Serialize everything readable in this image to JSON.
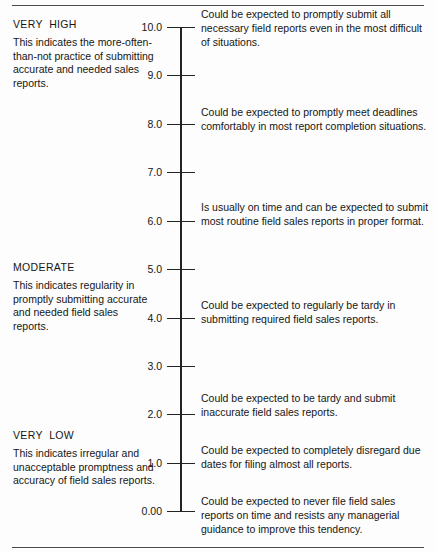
{
  "figure": {
    "name": "behaviorally-anchored-rating-scale",
    "orientation": "vertical",
    "axis": {
      "min": 0.0,
      "max": 10.0,
      "ticks": [
        {
          "label": "10.0",
          "value": 10.0
        },
        {
          "label": "9.0",
          "value": 9.0
        },
        {
          "label": "8.0",
          "value": 8.0
        },
        {
          "label": "7.0",
          "value": 7.0
        },
        {
          "label": "6.0",
          "value": 6.0
        },
        {
          "label": "5.0",
          "value": 5.0
        },
        {
          "label": "4.0",
          "value": 4.0
        },
        {
          "label": "3.0",
          "value": 3.0
        },
        {
          "label": "2.0",
          "value": 2.0
        },
        {
          "label": "1.0",
          "value": 1.0
        },
        {
          "label": "0.00",
          "value": 0.0
        }
      ]
    }
  },
  "anchors": [
    {
      "title": "VERY  HIGH",
      "description": "This indicates the more-often-than-not practice of submitting accurate and needed sales reports."
    },
    {
      "title": "MODERATE",
      "description": "This indicates regularity in promptly submitting accurate and needed field sales reports."
    },
    {
      "title": "VERY  LOW",
      "description": "This indicates irregular and unacceptable promptness and accuracy of field sales reports."
    }
  ],
  "statements": [
    {
      "anchor_value": 10.0,
      "text": "Could be expected to promptly submit all necessary field reports even in the most difficult of situations."
    },
    {
      "anchor_value": 8.0,
      "text": "Could be expected to promptly meet deadlines comfortably in most report completion situations."
    },
    {
      "anchor_value": 6.0,
      "text": "Is usually on time and can be expected to submit most routine field sales reports in proper format."
    },
    {
      "anchor_value": 4.0,
      "text": "Could be expected to regularly be tardy in submitting required field sales reports."
    },
    {
      "anchor_value": 2.0,
      "text": "Could be expected to be tardy and submit inaccurate field sales reports."
    },
    {
      "anchor_value": 1.0,
      "text": "Could be expected to completely disregard due dates for filing almost all reports."
    },
    {
      "anchor_value": 0.0,
      "text": "Could be expected to never file field sales reports on time and resists any managerial guidance to improve this tendency."
    }
  ],
  "colors": {
    "ink": "#161616",
    "rule": "#4a4a4a",
    "axis": "#232323",
    "background": "#fdfdfd"
  }
}
